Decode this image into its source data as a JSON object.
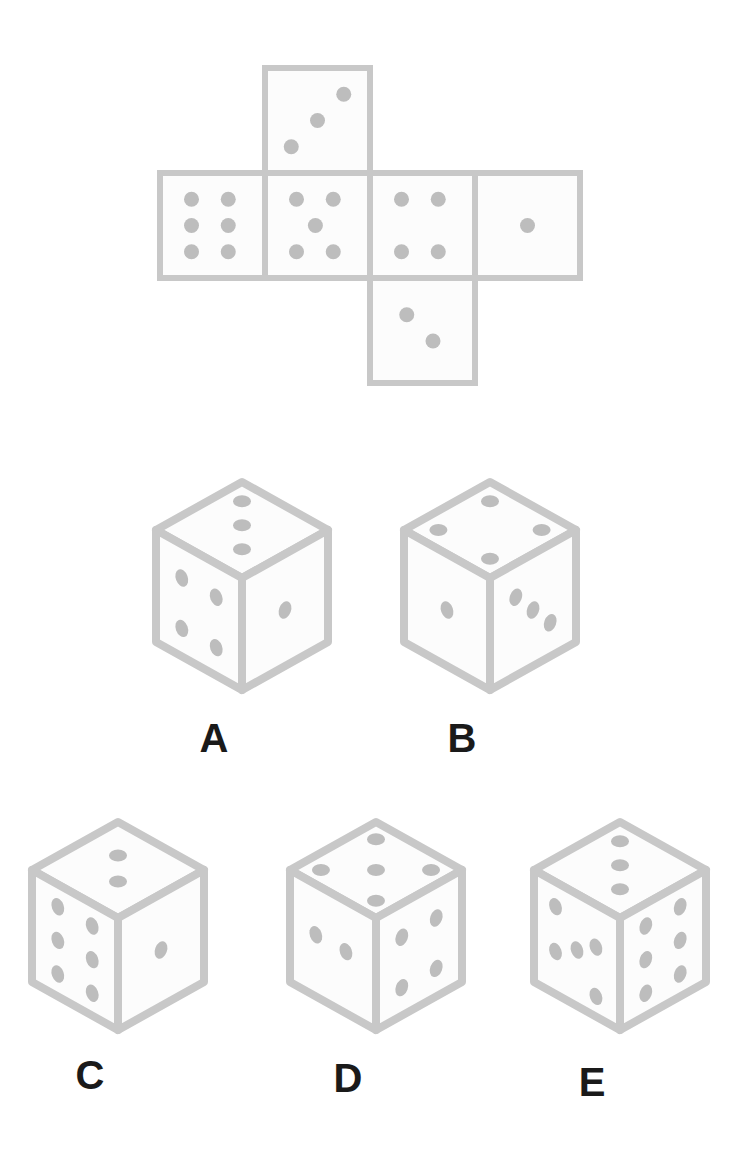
{
  "puzzle": {
    "type": "cube-net-folding",
    "colors": {
      "background": "#ffffff",
      "face_fill": "#fcfcfc",
      "outline": "#c8c8c8",
      "pip": "#bdbdbd",
      "label": "#1a1a1a"
    },
    "net": {
      "faces": [
        {
          "id": "top",
          "value": 3,
          "col": 1,
          "row": 0,
          "layout": "diagonal-up"
        },
        {
          "id": "left",
          "value": 6,
          "col": 0,
          "row": 1,
          "layout": "six"
        },
        {
          "id": "center",
          "value": 5,
          "col": 1,
          "row": 1,
          "layout": "five"
        },
        {
          "id": "right",
          "value": 4,
          "col": 2,
          "row": 1,
          "layout": "four"
        },
        {
          "id": "far-right",
          "value": 1,
          "col": 3,
          "row": 1,
          "layout": "one"
        },
        {
          "id": "bottom",
          "value": 2,
          "col": 2,
          "row": 2,
          "layout": "diagonal-down"
        }
      ]
    },
    "options": [
      {
        "label": "A",
        "top": 3,
        "left": 4,
        "right": 1
      },
      {
        "label": "B",
        "top": 4,
        "left": 1,
        "right": 3
      },
      {
        "label": "C",
        "top": 2,
        "left": 6,
        "right": 1
      },
      {
        "label": "D",
        "top": 5,
        "left": 2,
        "right": 4
      },
      {
        "label": "E",
        "top": 3,
        "left": 5,
        "right": 6
      }
    ]
  }
}
